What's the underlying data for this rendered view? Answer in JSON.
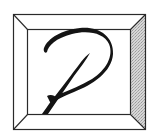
{
  "logo": {
    "letter": "P",
    "style": "calligraphic letter in beveled square frame",
    "colors": {
      "background": "#ffffff",
      "frame_line": "#2a2a2a",
      "bevel_light": "#ffffff",
      "bevel_shaded": "#c9c9c9",
      "glyph": "#141414"
    }
  }
}
